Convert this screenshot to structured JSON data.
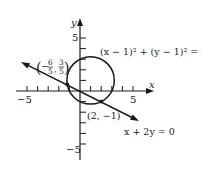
{
  "figure": {
    "axes": {
      "x_label": "x",
      "y_label": "y",
      "x_tick_labels": {
        "neg": "−5",
        "pos": "5"
      },
      "y_tick_labels": {
        "pos": "5",
        "neg": "−5"
      },
      "x_range": [
        -5,
        5
      ],
      "y_range": [
        -5,
        5
      ]
    },
    "circle": {
      "equation": "(x − 1)² + (y − 1)² = 5",
      "center": [
        1,
        1
      ],
      "radius_squared": 5
    },
    "line": {
      "equation": "x + 2y = 0"
    },
    "points": [
      {
        "name": "intersection-left",
        "label": "(−6/5, 3/5)",
        "x": -1.2,
        "y": 0.6
      },
      {
        "name": "intersection-right",
        "label": "(2, −1)",
        "x": 2,
        "y": -1
      }
    ],
    "labels": {
      "circle_eq": "(x − 1)² + (y − 1)² = 5",
      "line_eq": "x + 2y = 0",
      "point_right": "(2, −1)",
      "point_left_num_x": "6",
      "point_left_den_x": "5",
      "point_left_num_y": "3",
      "point_left_den_y": "5"
    }
  }
}
